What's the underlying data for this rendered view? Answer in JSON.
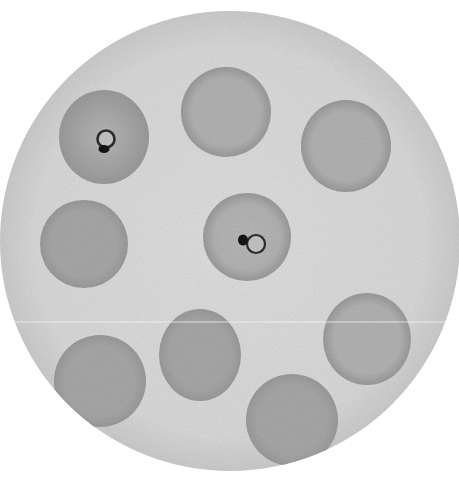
{
  "image": {
    "title": "Blood smear microscopy field",
    "description": "Grayscale illustration of red blood cells in a circular microscope field; two cells contain ring-form parasites",
    "width": 459,
    "height": 478
  },
  "colors": {
    "background": "#ffffff",
    "field": "#dcdcdc",
    "field_edge": "#cfcfcf",
    "cell": "#a9a9a9",
    "cell_light": "#b4b4b4",
    "cell_infected": "#a4a4a4",
    "cell_infected_center": "#b9b9b9",
    "ring": "#2c2c2c",
    "chromatin": "#141414",
    "scan_line": "#f2f2f2"
  },
  "field": {
    "cx": 230,
    "cy": 241,
    "r": 230
  },
  "scan_line_y": 322,
  "cells": [
    {
      "id": "cell-top-left",
      "cx": 104,
      "cy": 137,
      "rx": 45,
      "ry": 47,
      "tone": "cell_infected",
      "infected": true,
      "ring": {
        "cx": 106,
        "cy": 139,
        "r": 8.5,
        "stroke": 2.6
      },
      "chromatin": {
        "cx": 104,
        "cy": 149,
        "rx": 5.5,
        "ry": 4
      }
    },
    {
      "id": "cell-top-center",
      "cx": 226,
      "cy": 112,
      "rx": 45,
      "ry": 45,
      "tone": "cell_light",
      "infected": false
    },
    {
      "id": "cell-top-right",
      "cx": 346,
      "cy": 146,
      "rx": 45,
      "ry": 46,
      "tone": "cell_light",
      "infected": false
    },
    {
      "id": "cell-mid-left",
      "cx": 84,
      "cy": 244,
      "rx": 44,
      "ry": 44,
      "tone": "cell",
      "infected": false
    },
    {
      "id": "cell-center",
      "cx": 247,
      "cy": 237,
      "rx": 44,
      "ry": 44,
      "tone": "cell_light",
      "infected": true,
      "ring": {
        "cx": 256,
        "cy": 244,
        "r": 9,
        "stroke": 2.2
      },
      "chromatin": {
        "cx": 243,
        "cy": 240,
        "rx": 5,
        "ry": 5.5
      }
    },
    {
      "id": "cell-bottom-left",
      "cx": 100,
      "cy": 381,
      "rx": 46,
      "ry": 46,
      "tone": "cell",
      "infected": false
    },
    {
      "id": "cell-bottom-center-left",
      "cx": 200,
      "cy": 355,
      "rx": 41,
      "ry": 46,
      "tone": "cell",
      "infected": false
    },
    {
      "id": "cell-right-lower",
      "cx": 367,
      "cy": 339,
      "rx": 44,
      "ry": 46,
      "tone": "cell_light",
      "infected": false
    },
    {
      "id": "cell-bottom-center-right",
      "cx": 292,
      "cy": 420,
      "rx": 46,
      "ry": 46,
      "tone": "cell",
      "infected": false
    }
  ]
}
